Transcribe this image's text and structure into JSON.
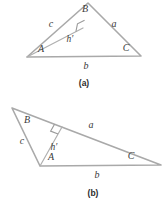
{
  "figure": {
    "line_color": "#a9a9a9",
    "label_color": "#3a3a3a",
    "background": "#ffffff",
    "panels": [
      {
        "id": "a",
        "caption": "(a)",
        "caption_pos": {
          "x": 84,
          "y": 84
        },
        "type": "acute-triangle",
        "vertices": {
          "A": {
            "x": 27,
            "y": 57
          },
          "B": {
            "x": 88,
            "y": 3
          },
          "C": {
            "x": 141,
            "y": 56
          }
        },
        "foot_of_altitude": {
          "x": 83,
          "y": 28
        },
        "right_angle_marker": {
          "x": 83,
          "y": 28,
          "size": 8
        },
        "labels": [
          {
            "name": "vertex-label-A",
            "text": "A",
            "x": 41,
            "y": 50
          },
          {
            "name": "vertex-label-B",
            "text": "B",
            "x": 85,
            "y": 10
          },
          {
            "name": "vertex-label-C",
            "text": "C",
            "x": 126,
            "y": 49
          },
          {
            "name": "side-label-c",
            "text": "c",
            "x": 51,
            "y": 25
          },
          {
            "name": "side-label-a",
            "text": "a",
            "x": 114,
            "y": 25
          },
          {
            "name": "side-label-b",
            "text": "b",
            "x": 86,
            "y": 67
          },
          {
            "name": "altitude-label-h-prime",
            "text": "h′",
            "x": 70,
            "y": 40
          }
        ]
      },
      {
        "id": "b",
        "caption": "(b)",
        "caption_pos": {
          "x": 93,
          "y": 194
        },
        "type": "obtuse-triangle",
        "vertices": {
          "A": {
            "x": 40,
            "y": 166
          },
          "B": {
            "x": 12,
            "y": 108
          },
          "C": {
            "x": 161,
            "y": 165
          }
        },
        "foot_of_altitude": {
          "x": 62,
          "y": 127
        },
        "right_angle_marker": {
          "x": 62,
          "y": 127,
          "size": 8
        },
        "extension_endpoint": {
          "x": 161,
          "y": 165
        },
        "labels": [
          {
            "name": "vertex-label-A",
            "text": "A",
            "x": 51,
            "y": 158
          },
          {
            "name": "vertex-label-B",
            "text": "B",
            "x": 27,
            "y": 121
          },
          {
            "name": "vertex-label-C",
            "text": "C",
            "x": 131,
            "y": 157
          },
          {
            "name": "side-label-c",
            "text": "c",
            "x": 22,
            "y": 142
          },
          {
            "name": "side-label-a",
            "text": "a",
            "x": 91,
            "y": 126
          },
          {
            "name": "side-label-b",
            "text": "b",
            "x": 97,
            "y": 176
          },
          {
            "name": "altitude-label-h-prime",
            "text": "h′",
            "x": 54,
            "y": 148
          }
        ]
      }
    ]
  }
}
